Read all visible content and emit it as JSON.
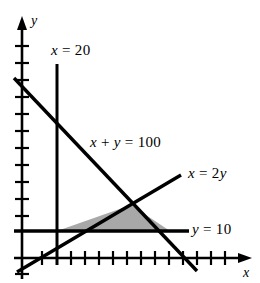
{
  "figure": {
    "kind": "line-graph",
    "background_color": "#ffffff",
    "ink_color": "#000000",
    "shade_color": "#a8a8a8",
    "axes": {
      "x_axis_label": "x",
      "y_axis_label": "y",
      "x_axis_arrow": "arrow-right",
      "y_axis_arrow": "arrow-up",
      "x_tick_count": 14,
      "y_tick_count": 12
    },
    "labels": {
      "line_x_eq_20": "x = 20",
      "line_x_plus_y_eq_100": "x + y = 100",
      "line_x_eq_2y": "x = 2y",
      "line_y_eq_10": "y = 10"
    },
    "shaded_region": {
      "name": "feasible-region",
      "fill": "#a8a8a8",
      "vertex_labels": [
        "x = 20 ∩ y = 10",
        "x = 2y ∩ x + y = 100",
        "y = 10 ∩ x + y = 100"
      ]
    }
  },
  "chart_data": {
    "type": "line",
    "title": "",
    "xlabel": "x",
    "ylabel": "y",
    "xlim": [
      -10,
      130
    ],
    "ylim": [
      -10,
      130
    ],
    "grid": false,
    "legend": "none",
    "series": [
      {
        "name": "x = 20",
        "label": "x = 20",
        "kind": "vertical-line",
        "x": [
          20,
          20
        ],
        "y": [
          -5,
          115
        ]
      },
      {
        "name": "x + y = 100",
        "label": "x + y = 100",
        "kind": "line",
        "slope": -1,
        "intercept": 100,
        "x": [
          -5,
          115
        ],
        "y": [
          105,
          -15
        ]
      },
      {
        "name": "x = 2y",
        "label": "x = 2y",
        "kind": "line",
        "slope": 0.5,
        "intercept": 0,
        "x": [
          -5,
          105
        ],
        "y": [
          -2.5,
          52.5
        ]
      },
      {
        "name": "y = 10",
        "label": "y = 10",
        "kind": "horizontal-line",
        "x": [
          -5,
          105
        ],
        "y": [
          10,
          10
        ]
      }
    ],
    "shaded_polygon": {
      "name": "feasible region",
      "points": [
        [
          20,
          10
        ],
        [
          66.7,
          33.3
        ],
        [
          90,
          10
        ]
      ],
      "fill": "#a8a8a8"
    },
    "annotations": [
      {
        "text": "x = 20",
        "x": 28,
        "y": 112
      },
      {
        "text": "x + y = 100",
        "x": 48,
        "y": 60
      },
      {
        "text": "x = 2y",
        "x": 104,
        "y": 42
      },
      {
        "text": "y = 10",
        "x": 104,
        "y": 12
      }
    ]
  }
}
